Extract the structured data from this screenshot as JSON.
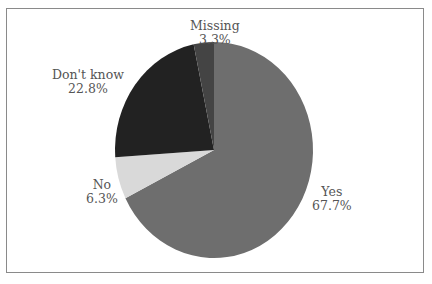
{
  "chart_data": {
    "type": "pie",
    "title": "",
    "slices": [
      {
        "label": "Yes",
        "value": 67.7,
        "display": "67.7%",
        "color": "#6e6e6e"
      },
      {
        "label": "No",
        "value": 6.3,
        "display": "6.3%",
        "color": "#d9d9d9"
      },
      {
        "label": "Don't know",
        "value": 22.8,
        "display": "22.8%",
        "color": "#222222"
      },
      {
        "label": "Missing",
        "value": 3.3,
        "display": "3.3%",
        "color": "#444444"
      }
    ],
    "start_angle_deg": 0,
    "direction": "clockwise",
    "legend": "none (direct labels)"
  },
  "labels": {
    "yes": {
      "name": "Yes",
      "pct": "67.7%"
    },
    "no": {
      "name": "No",
      "pct": "6.3%"
    },
    "dontknow": {
      "name": "Don't know",
      "pct": "22.8%"
    },
    "missing": {
      "name": "Missing",
      "pct": "3.3%"
    }
  }
}
